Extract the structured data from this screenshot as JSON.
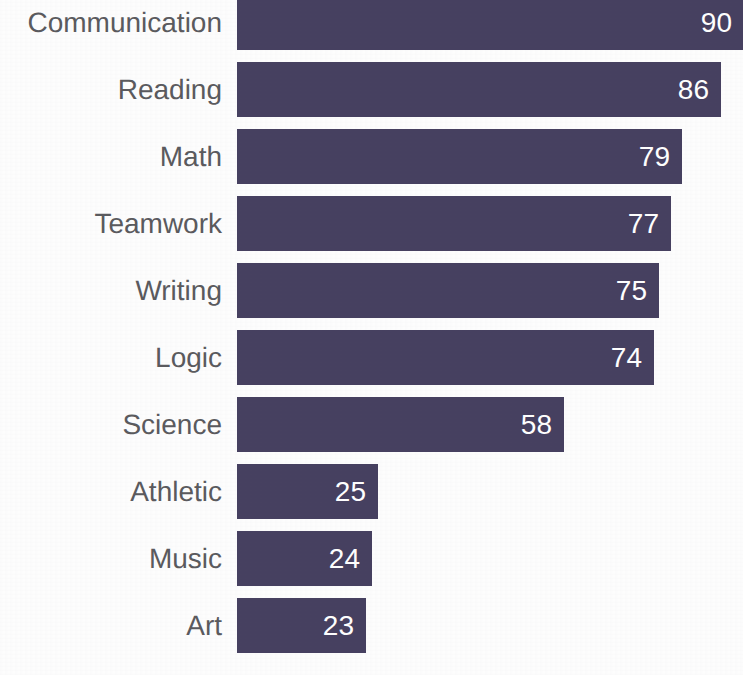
{
  "chart_data": {
    "type": "bar",
    "orientation": "horizontal",
    "title": "",
    "subtitle": "",
    "xlabel": "",
    "ylabel": "",
    "grid": false,
    "legend": null,
    "axis_visible": false,
    "tick_labels_x": [],
    "xlim": [
      0,
      90
    ],
    "categories": [
      "Communication",
      "Reading",
      "Math",
      "Teamwork",
      "Writing",
      "Logic",
      "Science",
      "Athletic",
      "Music",
      "Art"
    ],
    "values": [
      90,
      86,
      79,
      77,
      75,
      74,
      58,
      25,
      24,
      23
    ],
    "value_labels": [
      "90",
      "86",
      "79",
      "77",
      "75",
      "74",
      "58",
      "25",
      "24",
      "23"
    ],
    "bar_color": "#464060",
    "value_label_color": "#ffffff",
    "category_label_color": "#5a5a5e",
    "background_color": "#fdfdfd"
  },
  "layout": {
    "bar_origin_x": 237,
    "bar_height": 55,
    "row_pitch": 67,
    "first_row_top": -5,
    "px_per_unit": 5.63,
    "label_right_edge": 222
  }
}
